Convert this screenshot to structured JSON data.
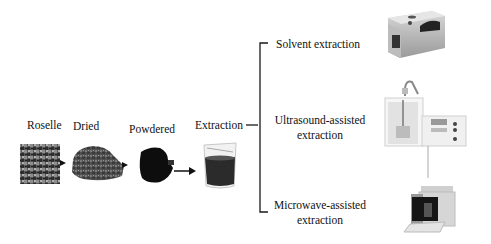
{
  "process_steps": [
    {
      "label": "Roselle",
      "image": "roselle-calyces-photo"
    },
    {
      "label": "Dried",
      "image": "dried-roselle-pile-photo"
    },
    {
      "label": "Powdered",
      "image": "roselle-powder-photo"
    },
    {
      "label": "Extraction",
      "image": "extract-beaker-photo"
    }
  ],
  "methods": [
    {
      "line1": "Solvent extraction",
      "line2": "",
      "image": "water-bath-apparatus"
    },
    {
      "line1": "Ultrasound-assisted",
      "line2": "extraction",
      "image": "ultrasonic-processor-apparatus"
    },
    {
      "line1": "Microwave-assisted",
      "line2": "extraction",
      "image": "microwave-extractor-apparatus"
    }
  ],
  "colors": {
    "line": "#1a1a1a",
    "background": "#ffffff"
  }
}
